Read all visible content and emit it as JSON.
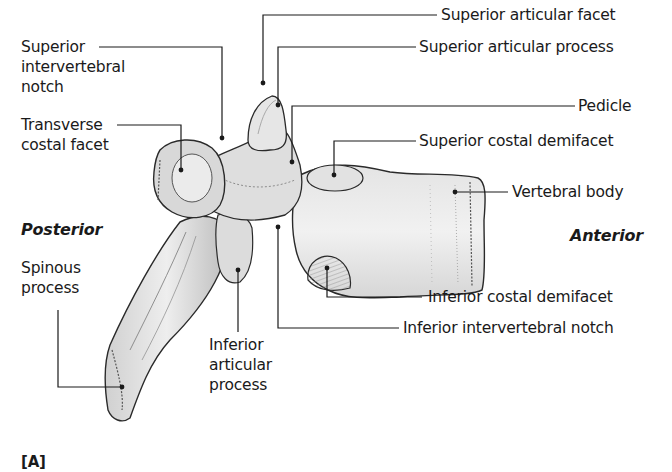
{
  "figure": {
    "panel_tag": "[A]",
    "orientation": {
      "posterior": "Posterior",
      "anterior": "Anterior"
    },
    "labels": {
      "superior_intervertebral_notch": [
        "Superior",
        "intervertebral",
        "notch"
      ],
      "transverse_costal_facet": [
        "Transverse",
        "costal facet"
      ],
      "spinous_process": [
        "Spinous",
        "process"
      ],
      "inferior_articular_process": [
        "Inferior",
        "articular",
        "process"
      ],
      "superior_articular_facet": "Superior articular facet",
      "superior_articular_process": "Superior articular process",
      "pedicle": "Pedicle",
      "superior_costal_demifacet": "Superior costal demifacet",
      "vertebral_body": "Vertebral body",
      "inferior_costal_demifacet": "Inferior costal demifacet",
      "inferior_intervertebral_notch": "Inferior intervertebral notch"
    },
    "colors": {
      "ink": "#1a1a1a",
      "bone_light": "#ececec",
      "bone_mid": "#cfcfcf",
      "bone_shade": "#9a9a9a",
      "background": "#ffffff"
    }
  }
}
